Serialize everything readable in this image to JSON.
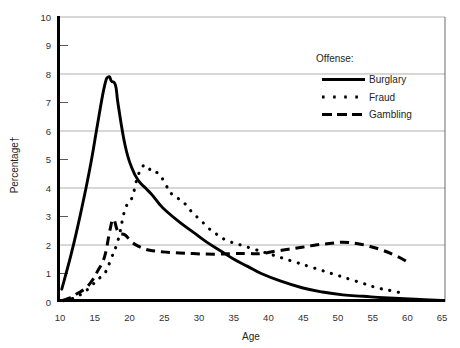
{
  "chart_data": {
    "type": "line",
    "title": "",
    "xlabel": "Age",
    "ylabel": "Percentage†",
    "xlim": [
      10,
      67
    ],
    "ylim": [
      0,
      10
    ],
    "xticks": [
      10,
      15,
      20,
      25,
      30,
      35,
      40,
      45,
      50,
      55,
      60,
      65
    ],
    "yticks": [
      0,
      1,
      2,
      3,
      4,
      5,
      6,
      7,
      8,
      9,
      10
    ],
    "grid": "horizontal-major-even",
    "gridlines_at": [
      2,
      4,
      6,
      8,
      10
    ],
    "legend": {
      "title": "Offense:",
      "position": "top-right-inside",
      "entries": [
        {
          "name": "Burglary",
          "style": "solid"
        },
        {
          "name": "Fraud",
          "style": "dotted"
        },
        {
          "name": "Gambling",
          "style": "dashed"
        }
      ]
    },
    "series": [
      {
        "name": "Burglary",
        "style": "solid",
        "color": "#000000",
        "x": [
          10.7,
          12,
          13,
          14,
          15,
          16,
          17,
          17.6,
          18,
          18.6,
          19,
          20,
          21,
          22,
          23,
          24,
          25,
          26,
          28,
          30,
          32,
          34,
          36,
          38,
          40,
          43,
          46,
          49,
          52,
          55,
          58,
          61,
          64,
          66.5
        ],
        "y": [
          0.45,
          1.6,
          2.6,
          3.7,
          4.9,
          6.3,
          7.6,
          7.9,
          7.75,
          7.6,
          6.9,
          5.5,
          4.7,
          4.25,
          4.0,
          3.75,
          3.45,
          3.2,
          2.8,
          2.45,
          2.1,
          1.8,
          1.5,
          1.25,
          1.0,
          0.72,
          0.5,
          0.35,
          0.25,
          0.2,
          0.15,
          0.12,
          0.08,
          0.05
        ]
      },
      {
        "name": "Fraud",
        "style": "dotted",
        "color": "#000000",
        "x": [
          11,
          12,
          13,
          14,
          15,
          16,
          17,
          18,
          19,
          20,
          21,
          22,
          23,
          24,
          25,
          26,
          27,
          28,
          29,
          30,
          31,
          32,
          33,
          34,
          35,
          37,
          39,
          41,
          43,
          45,
          47,
          49,
          51,
          53,
          55,
          57,
          59,
          61
        ],
        "y": [
          0.05,
          0.1,
          0.2,
          0.35,
          0.55,
          0.8,
          1.0,
          1.55,
          2.2,
          3.25,
          3.65,
          4.5,
          4.8,
          4.55,
          4.5,
          4.1,
          3.75,
          3.6,
          3.4,
          3.1,
          2.9,
          2.65,
          2.45,
          2.3,
          2.15,
          2.0,
          1.85,
          1.7,
          1.55,
          1.4,
          1.25,
          1.1,
          0.95,
          0.8,
          0.65,
          0.5,
          0.4,
          0.3
        ]
      },
      {
        "name": "Gambling",
        "style": "dashed",
        "color": "#000000",
        "x": [
          10.8,
          12,
          13,
          14,
          15,
          16,
          17,
          17.8,
          18.3,
          19,
          20,
          21,
          22,
          23,
          24,
          26,
          28,
          30,
          32,
          34,
          36,
          38,
          40,
          42,
          44,
          46,
          48,
          50,
          52,
          54,
          56,
          58,
          60,
          61.5
        ],
        "y": [
          0.05,
          0.15,
          0.3,
          0.45,
          0.7,
          1.1,
          1.6,
          2.55,
          2.9,
          2.45,
          2.35,
          2.1,
          1.95,
          1.85,
          1.8,
          1.75,
          1.72,
          1.7,
          1.68,
          1.68,
          1.7,
          1.7,
          1.7,
          1.78,
          1.85,
          1.92,
          2.0,
          2.05,
          2.1,
          2.05,
          1.95,
          1.8,
          1.6,
          1.4
        ]
      }
    ]
  },
  "labels": {
    "y_axis_title": "Percentage†",
    "x_axis_title": "Age",
    "legend_title": "Offense:",
    "legend_burglary": "Burglary",
    "legend_fraud": "Fraud",
    "legend_gambling": "Gambling",
    "y_0": "0",
    "y_1": "1",
    "y_2": "2",
    "y_3": "3",
    "y_4": "4",
    "y_5": "5",
    "y_6": "6",
    "y_7": "7",
    "y_8": "8",
    "y_9": "9",
    "y_10": "10",
    "x_10": "10",
    "x_15": "15",
    "x_20": "20",
    "x_25": "25",
    "x_30": "30",
    "x_35": "35",
    "x_40": "40",
    "x_45": "45",
    "x_50": "50",
    "x_55": "55",
    "x_60": "60",
    "x_65": "65"
  }
}
